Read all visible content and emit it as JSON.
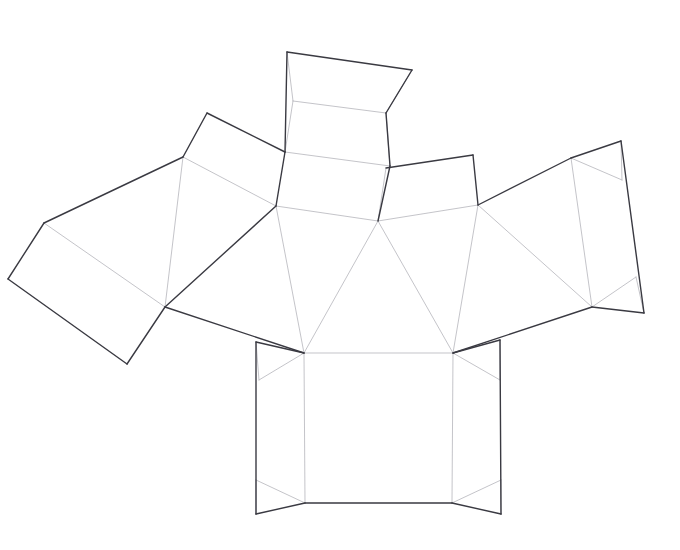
{
  "document": {
    "title": "Polyhedron Unfolding Net",
    "kind": "wireframe-net-diagram",
    "background_color": "#ffffff",
    "canvas": {
      "width": 680,
      "height": 550
    }
  },
  "style": {
    "outer_edge_color": "#3a3a42",
    "outer_edge_width": 1.4,
    "fold_edge_color": "#b9b9bf",
    "fold_edge_width": 0.85,
    "face_fill_color": "#ffffff"
  },
  "geometry": {
    "vertices": {
      "top_flap_tl": [
        287,
        52
      ],
      "top_flap_tr": [
        412,
        70
      ],
      "top_neck_l": [
        293,
        101
      ],
      "top_neck_r": [
        386,
        113
      ],
      "top_body_l": [
        285,
        152
      ],
      "top_body_r": [
        390,
        166
      ],
      "hub_left": [
        276,
        206
      ],
      "hub_mid": [
        378,
        221
      ],
      "hub_right": [
        478,
        205
      ],
      "ul_flap_top": [
        207,
        113
      ],
      "ul_flap_left": [
        183,
        157
      ],
      "lw_far_top": [
        44,
        223
      ],
      "lw_far_left": [
        8,
        279
      ],
      "lw_far_bottom": [
        127,
        364
      ],
      "lw_hinge": [
        165,
        307
      ],
      "mr_flap_tl": [
        386,
        168
      ],
      "mr_flap_tr": [
        473,
        155
      ],
      "rw_top_left": [
        571,
        158
      ],
      "rw_top_right": [
        621,
        141
      ],
      "rw_far_right": [
        644,
        313
      ],
      "rw_mid_right": [
        622,
        180
      ],
      "rw_inner_right": [
        636,
        277
      ],
      "rw_hinge": [
        592,
        307
      ],
      "base_tl_outer": [
        256,
        342
      ],
      "base_tr_outer": [
        500,
        340
      ],
      "base_bl_outer": [
        256,
        514
      ],
      "base_br_outer": [
        501,
        514
      ],
      "base_tl_inner": [
        304,
        353
      ],
      "base_tr_inner": [
        453,
        353
      ],
      "base_bl_inner": [
        305,
        503
      ],
      "base_br_inner": [
        452,
        503
      ],
      "base_l_mid_top": [
        259,
        380
      ],
      "base_r_mid_top": [
        500,
        380
      ],
      "base_l_mid_bot": [
        256,
        480
      ],
      "base_r_mid_bot": [
        501,
        480
      ]
    },
    "faces": [
      {
        "name": "top-flap",
        "points": "287,52 412,70 386,113 293,101"
      },
      {
        "name": "top-band",
        "points": "293,101 386,113 390,166 285,152"
      },
      {
        "name": "top-panel-lower",
        "points": "285,152 390,166 378,221 276,206"
      },
      {
        "name": "upper-left-flap",
        "points": "207,113 285,152 276,206 183,157"
      },
      {
        "name": "left-wing-panel",
        "points": "183,157 276,206 165,307 44,223"
      },
      {
        "name": "left-wing-outer",
        "points": "44,223 165,307 127,364 8,279"
      },
      {
        "name": "left-inner-triangle",
        "points": "276,206 304,353 165,307"
      },
      {
        "name": "center-triangle",
        "points": "276,206 378,221 304,353"
      },
      {
        "name": "center-right-tri",
        "points": "378,221 453,353 304,353"
      },
      {
        "name": "right-center-tri",
        "points": "378,221 478,205 453,353"
      },
      {
        "name": "mid-right-flap",
        "points": "386,168 473,155 478,205 378,221"
      },
      {
        "name": "right-inner-tri",
        "points": "478,205 592,307 453,353"
      },
      {
        "name": "right-wing-panel",
        "points": "478,205 571,158 592,307"
      },
      {
        "name": "right-wing-outer",
        "points": "571,158 621,141 644,313 592,307"
      },
      {
        "name": "base-square",
        "points": "304,353 453,353 452,503 305,503"
      },
      {
        "name": "base-left-flap",
        "points": "256,342 304,353 305,503 256,514"
      },
      {
        "name": "base-right-flap",
        "points": "453,353 500,340 501,514 452,503"
      }
    ],
    "outer_edges": [
      "287,52 412,70",
      "287,52 285,152",
      "285,152 276,206",
      "412,70 386,113",
      "386,113 390,166",
      "390,166 378,221",
      "207,113 285,152",
      "207,113 183,157",
      "183,157 44,223",
      "44,223 8,279",
      "8,279 127,364",
      "127,364 165,307",
      "165,307 276,206",
      "165,307 304,353",
      "386,168 473,155",
      "473,155 478,205",
      "478,205 571,158",
      "571,158 621,141",
      "621,141 644,313",
      "644,313 592,307",
      "592,307 453,353",
      "304,353 256,342",
      "453,353 500,340",
      "256,342 256,514",
      "500,340 501,514",
      "256,514 305,503",
      "501,514 452,503",
      "305,503 452,503"
    ],
    "fold_edges": [
      "293,101 386,113",
      "287,52 293,101",
      "412,70 386,113",
      "285,152 390,166",
      "293,101 285,152",
      "386,113 390,166",
      "276,206 378,221",
      "378,221 478,205",
      "183,157 276,206",
      "183,157 165,307",
      "44,223 165,307",
      "276,206 304,353",
      "378,221 304,353",
      "378,221 453,353",
      "478,205 453,353",
      "478,205 592,307",
      "571,158 592,307",
      "571,158 622,180",
      "622,180 621,141",
      "592,307 636,277",
      "636,277 644,313",
      "386,168 378,221",
      "304,353 453,353",
      "304,353 259,380",
      "259,380 256,342",
      "453,353 500,380",
      "500,380 500,340",
      "305,503 256,480",
      "256,480 256,514",
      "452,503 501,480",
      "501,480 501,514",
      "304,353 305,503",
      "453,353 452,503"
    ]
  }
}
